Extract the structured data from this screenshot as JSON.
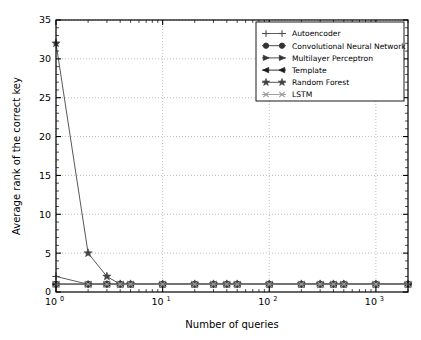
{
  "chart_data": {
    "type": "line",
    "title": "",
    "xlabel": "Number of queries",
    "ylabel": "Average rank of the correct key",
    "xscale": "log",
    "yscale": "linear",
    "xlim": [
      1,
      2000
    ],
    "ylim": [
      0,
      35
    ],
    "grid": true,
    "grid_style": "dotted",
    "grid_color": "#b0b0b0",
    "legend_position": "upper right",
    "x": [
      1,
      2,
      3,
      4,
      5,
      10,
      20,
      30,
      40,
      50,
      100,
      200,
      300,
      400,
      500,
      1000,
      2000
    ],
    "series": [
      {
        "name": "Autoencoder",
        "marker": "plus",
        "color": "#4d4d4d",
        "values": [
          2,
          1,
          1,
          1,
          1,
          1,
          1,
          1,
          1,
          1,
          1,
          1,
          1,
          1,
          1,
          1,
          1
        ]
      },
      {
        "name": "Convolutional Neural Network",
        "marker": "circle",
        "color": "#333333",
        "values": [
          1,
          1,
          1,
          1,
          1,
          1,
          1,
          1,
          1,
          1,
          1,
          1,
          1,
          1,
          1,
          1,
          1
        ]
      },
      {
        "name": "Multilayer Perceptron",
        "marker": "triangle-right",
        "color": "#333333",
        "values": [
          1,
          1,
          1,
          1,
          1,
          1,
          1,
          1,
          1,
          1,
          1,
          1,
          1,
          1,
          1,
          1,
          1
        ]
      },
      {
        "name": "Template",
        "marker": "triangle-left",
        "color": "#1a1a1a",
        "values": [
          1,
          1,
          1,
          1,
          1,
          1,
          1,
          1,
          1,
          1,
          1,
          1,
          1,
          1,
          1,
          1,
          1
        ]
      },
      {
        "name": "Random Forest",
        "marker": "star",
        "color": "#444444",
        "values": [
          32,
          5,
          2,
          1,
          1,
          1,
          1,
          1,
          1,
          1,
          1,
          1,
          1,
          1,
          1,
          1,
          1
        ]
      },
      {
        "name": "LSTM",
        "marker": "x",
        "color": "#999999",
        "values": [
          1,
          1,
          1,
          1,
          1,
          1,
          1,
          1,
          1,
          1,
          1,
          1,
          1,
          1,
          1,
          1,
          1
        ]
      }
    ],
    "yticks": [
      0,
      5,
      10,
      15,
      20,
      25,
      30,
      35
    ],
    "ytick_labels": [
      "0",
      "5",
      "10",
      "15",
      "20",
      "25",
      "30",
      "35"
    ],
    "xticks": [
      1,
      10,
      100,
      1000
    ],
    "xtick_labels": [
      {
        "base": "10",
        "exp": "0"
      },
      {
        "base": "10",
        "exp": "1"
      },
      {
        "base": "10",
        "exp": "2"
      },
      {
        "base": "10",
        "exp": "3"
      }
    ]
  },
  "legend": {
    "entries": [
      {
        "label": "Autoencoder"
      },
      {
        "label": "Convolutional Neural Network"
      },
      {
        "label": "Multilayer Perceptron"
      },
      {
        "label": "Template"
      },
      {
        "label": "Random Forest"
      },
      {
        "label": "LSTM"
      }
    ]
  }
}
